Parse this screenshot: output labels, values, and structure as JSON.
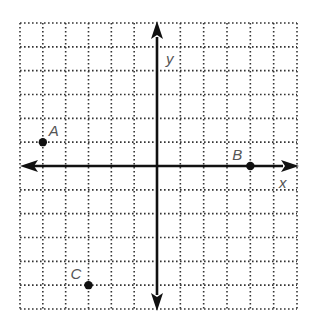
{
  "chart_data": {
    "type": "scatter",
    "title": "",
    "xlabel": "x",
    "ylabel": "y",
    "xlim": [
      -6,
      6
    ],
    "ylim": [
      -6,
      6
    ],
    "grid": true,
    "grid_style": "dotted",
    "axes_with_arrows": true,
    "points": [
      {
        "label": "A",
        "x": -5,
        "y": 1
      },
      {
        "label": "B",
        "x": 4,
        "y": 0
      },
      {
        "label": "C",
        "x": -3,
        "y": -5
      }
    ],
    "colors": {
      "grid": "#333333",
      "axis": "#111111",
      "point": "#111111",
      "label": "#555555"
    }
  }
}
